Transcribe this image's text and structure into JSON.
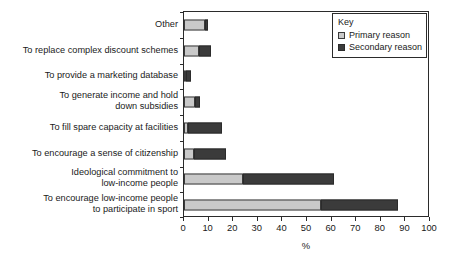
{
  "chart_data": {
    "type": "bar",
    "orientation": "horizontal",
    "stacked": true,
    "title": "",
    "xlabel": "%",
    "ylabel": "",
    "xlim": [
      0,
      100
    ],
    "xticks": [
      0,
      10,
      20,
      30,
      40,
      50,
      60,
      70,
      80,
      90,
      100
    ],
    "xtick_labels": [
      "0",
      "10",
      "20",
      "30",
      "40",
      "50",
      "60",
      "70",
      "80",
      "90",
      "100"
    ],
    "grid": false,
    "legend": {
      "title": "Key",
      "position": "top-right",
      "entries": [
        {
          "name": "Primary reason",
          "color": "#c9c9c9"
        },
        {
          "name": "Secondary reason",
          "color": "#3b3b3b"
        }
      ]
    },
    "categories": [
      "To encourage low-income people\nto participate in sport",
      "Ideological commitment to\nlow-income people",
      "To encourage a sense of citizenship",
      "To fill spare capacity at facilities",
      "To generate income and hold\ndown subsidies",
      "To provide a marketing database",
      "To replace complex discount schemes",
      "Other"
    ],
    "series": [
      {
        "name": "Primary reason",
        "color": "#c9c9c9",
        "values": [
          55.5,
          24,
          4,
          1.5,
          4.5,
          0.7,
          6,
          8.5
        ]
      },
      {
        "name": "Secondary reason",
        "color": "#3b3b3b",
        "values": [
          31.5,
          37,
          13,
          14,
          2,
          2.3,
          5,
          1.3
        ]
      }
    ],
    "totals": [
      87,
      61,
      17,
      15.5,
      6.5,
      3,
      11,
      9.8
    ]
  },
  "axis": {
    "x_title": "%"
  }
}
